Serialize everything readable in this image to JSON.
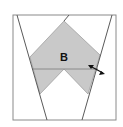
{
  "diagram": {
    "label": "B",
    "colors": {
      "background": "#ffffff",
      "frame": "#8a8a8a",
      "lines": "#5a5a5a",
      "shape_fill": "#c9c9c9",
      "shape_stroke": "#9a9a9a",
      "arrow": "#111111"
    },
    "arrow_icon": "double-headed-arrow"
  }
}
